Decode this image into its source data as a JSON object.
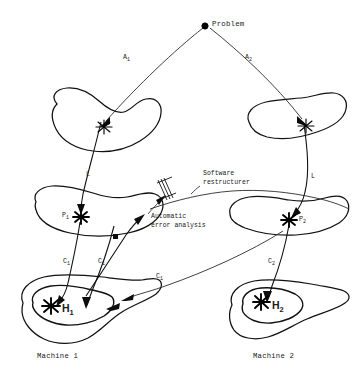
{
  "figure": {
    "background_color": "#ffffff",
    "ink_color": "#111111",
    "width": 362,
    "height": 373
  },
  "nodes": {
    "problem": {
      "label": "Problem",
      "marker": "filled-dot"
    },
    "p1": {
      "label": "P",
      "sub": "1",
      "marker": "star"
    },
    "p2": {
      "label": "P",
      "sub": "2",
      "marker": "star"
    },
    "h1": {
      "label": "H",
      "sub": "1",
      "marker": "star"
    },
    "h2": {
      "label": "H",
      "sub": "2",
      "marker": "star"
    }
  },
  "edges": {
    "a1": {
      "label": "A",
      "sub": "1"
    },
    "a2": {
      "label": "A",
      "sub": "2"
    },
    "l_left": {
      "label": "L"
    },
    "l_right": {
      "label": "L"
    },
    "c1_a": {
      "label": "C",
      "sub": "1"
    },
    "c1_b": {
      "label": "C",
      "sub": "1"
    },
    "c1_c": {
      "label": "C",
      "sub": "1"
    },
    "c2": {
      "label": "C",
      "sub": "2"
    }
  },
  "annotations": {
    "software_restructurer": {
      "line1": "Software",
      "line2": "restructurer"
    },
    "automatic_error_analysis": {
      "line1": "Automatic",
      "line2": "error analysis"
    }
  },
  "captions": {
    "machine_left": "Machine 1",
    "machine_right": "Machine 2"
  }
}
